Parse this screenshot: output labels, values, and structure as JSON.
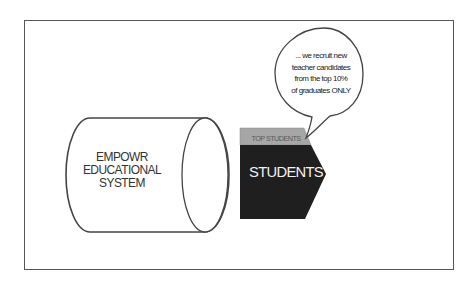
{
  "diagram": {
    "cylinder": {
      "label_lines": [
        "EMPOWR",
        "EDUCATIONAL",
        "SYSTEM"
      ]
    },
    "arrow": {
      "header_label": "TOP STUDENTS",
      "main_label": "STUDENTS",
      "colors": {
        "header_fill": "#a6a6a6",
        "body_fill": "#1f1f1f",
        "text": "#f2f2f2"
      }
    },
    "speech_bubble": {
      "lines": [
        "... we recruit new",
        "teacher candidates",
        "from the top 10%",
        "of graduates ONLY"
      ]
    },
    "frame_color": "#555555"
  }
}
